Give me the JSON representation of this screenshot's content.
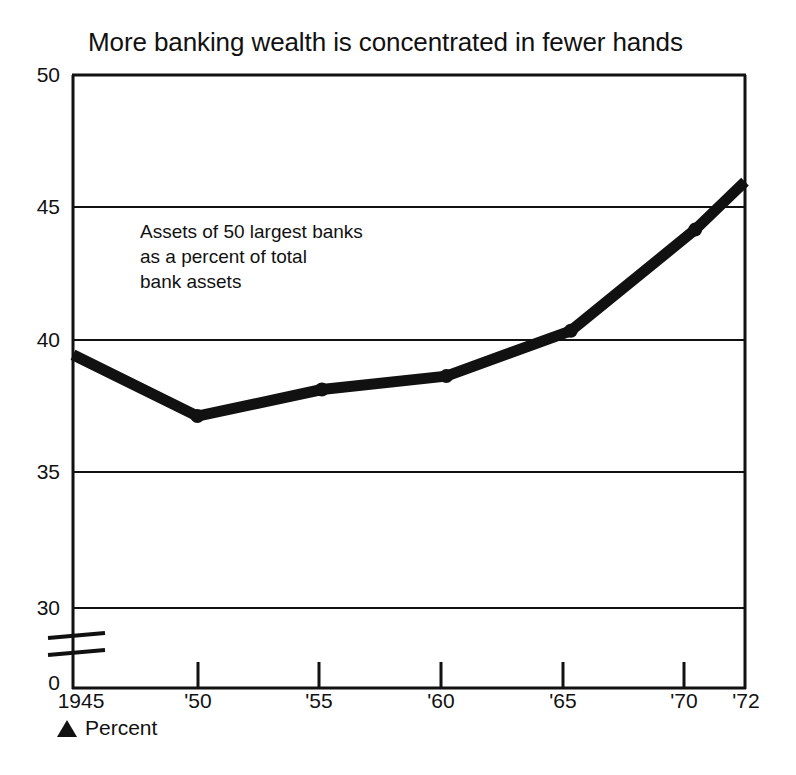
{
  "chart_data": {
    "type": "line",
    "title": "More banking wealth is concentrated in fewer hands",
    "annotation": "Assets of 50 largest banks\nas a percent of total\nbank assets",
    "xlabel": "",
    "ylabel": "",
    "units_note": "Percent",
    "units_marker_icon": "black-triangle-marker",
    "grid": true,
    "legend": "none",
    "axis_break": true,
    "axis_break_label": "0",
    "xlim": [
      1945,
      1972
    ],
    "ylim": [
      30,
      50
    ],
    "x": [
      1945,
      1950,
      1955,
      1960,
      1965,
      1970,
      1972
    ],
    "values": [
      39.5,
      37.2,
      38.2,
      38.7,
      40.4,
      44.2,
      46.0
    ],
    "categories": [
      "1945",
      "'50",
      "'55",
      "'60",
      "'65",
      "'70",
      "'72"
    ],
    "x_tick_labels": [
      "1945",
      "'50",
      "'55",
      "'60",
      "'65",
      "'70",
      "'72"
    ],
    "y_tick_labels": [
      "50",
      "45",
      "40",
      "35",
      "30",
      "0"
    ],
    "y_tick_values": [
      50,
      45,
      40,
      35,
      30,
      0
    ],
    "series": [
      {
        "name": "Assets of 50 largest banks as a percent of total bank assets",
        "color": "#111111",
        "values": [
          39.5,
          37.2,
          38.2,
          38.7,
          40.4,
          44.2,
          46.0
        ]
      }
    ],
    "colors": {
      "line": "#111111",
      "axis": "#111111",
      "grid": "#111111",
      "background": "#ffffff",
      "text": "#111111"
    }
  }
}
